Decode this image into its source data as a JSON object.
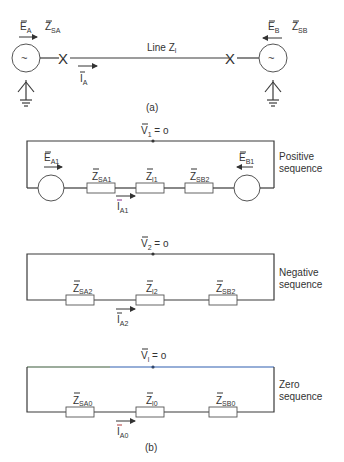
{
  "part_a": {
    "caption": "(a)",
    "source_a": {
      "emf": "E",
      "emf_sub": "A",
      "impedance": "Z",
      "impedance_sub": "SA",
      "symbol": "~"
    },
    "source_b": {
      "emf": "E",
      "emf_sub": "B",
      "impedance": "Z",
      "impedance_sub": "SB",
      "symbol": "~"
    },
    "line_label": "Line Z",
    "line_sub": "l",
    "current": "I",
    "current_sub": "A",
    "breaker_symbol": "X"
  },
  "part_b": {
    "caption": "(b)",
    "positive": {
      "title_line1": "Positive",
      "title_line2": "sequence",
      "voltage": "V",
      "voltage_sub": "1",
      "voltage_value": " = o",
      "emf_a": "E",
      "emf_a_sub": "A1",
      "emf_b": "E",
      "emf_b_sub": "B1",
      "z1": "Z",
      "z1_sub": "SA1",
      "z2": "Z",
      "z2_sub": "l1",
      "z3": "Z",
      "z3_sub": "SB2",
      "current": "I",
      "current_sub": "A1"
    },
    "negative": {
      "title_line1": "Negative",
      "title_line2": "sequence",
      "voltage": "V",
      "voltage_sub": "2",
      "voltage_value": " = o",
      "z1": "Z",
      "z1_sub": "SA2",
      "z2": "Z",
      "z2_sub": "l2",
      "z3": "Z",
      "z3_sub": "SB2",
      "current": "I",
      "current_sub": "A2"
    },
    "zero": {
      "title_line1": "Zero",
      "title_line2": "sequence",
      "voltage": "V",
      "voltage_sub": "l",
      "voltage_value": " = o",
      "z1": "Z",
      "z1_sub": "SA0",
      "z2": "Z",
      "z2_sub": "l0",
      "z3": "Z",
      "z3_sub": "SB0",
      "current": "I",
      "current_sub": "A0"
    }
  },
  "colors": {
    "wire": "#3a3a3a",
    "zero_top_wire": "#2f5fb0",
    "text": "#333333"
  }
}
